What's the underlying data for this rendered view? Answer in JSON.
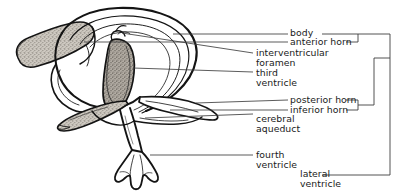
{
  "figure": {
    "kind": "anatomical-line-drawing",
    "ink_color": "#141414",
    "stipple_fill": "#b9b4ac",
    "paper_color": "#ffffff",
    "leader_color": "#3a3a3a"
  },
  "labels": {
    "body": "body",
    "anterior_horn": "anterior horn",
    "interventricular": "interventricular",
    "foramen": "foramen",
    "third": "third",
    "ventricle_third": "ventricle",
    "posterior_horn": "posterior horn",
    "inferior_horn": "inferior horn",
    "cerebral": "cerebral",
    "aqueduct": "aqueduct",
    "fourth": "fourth",
    "ventricle_fourth": "ventricle",
    "lateral": "lateral",
    "ventricle_lateral": "ventricle"
  },
  "bracket": {
    "groups_label": "lateral ventricle",
    "grouped_parts": [
      "body",
      "anterior horn",
      "posterior horn",
      "inferior horn"
    ]
  }
}
